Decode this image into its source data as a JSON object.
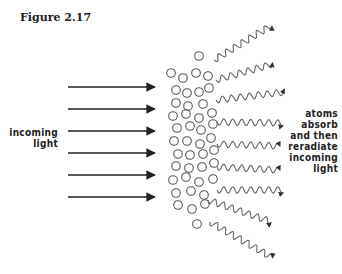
{
  "figure": {
    "title": "Figure 2.17",
    "left_label": [
      "incoming",
      "light"
    ],
    "right_label": [
      "atoms",
      "absorb",
      "and then",
      "reradiate",
      "incoming",
      "light"
    ]
  },
  "diagram": {
    "incoming_arrows": {
      "count": 6,
      "x_start": 68,
      "x_end": 155,
      "y": [
        87,
        109,
        131,
        153,
        175,
        197
      ]
    },
    "atoms": [
      [
        199,
        56
      ],
      [
        171,
        73
      ],
      [
        183,
        78
      ],
      [
        196,
        73
      ],
      [
        208,
        76
      ],
      [
        176,
        90
      ],
      [
        187,
        93
      ],
      [
        199,
        92
      ],
      [
        209,
        88
      ],
      [
        176,
        103
      ],
      [
        188,
        106
      ],
      [
        203,
        104
      ],
      [
        173,
        116
      ],
      [
        186,
        114
      ],
      [
        199,
        118
      ],
      [
        212,
        113
      ],
      [
        177,
        128
      ],
      [
        190,
        126
      ],
      [
        201,
        130
      ],
      [
        213,
        124
      ],
      [
        174,
        141
      ],
      [
        187,
        141
      ],
      [
        200,
        144
      ],
      [
        211,
        138
      ],
      [
        178,
        154
      ],
      [
        190,
        155
      ],
      [
        203,
        154
      ],
      [
        214,
        150
      ],
      [
        176,
        166
      ],
      [
        189,
        168
      ],
      [
        202,
        167
      ],
      [
        214,
        163
      ],
      [
        173,
        180
      ],
      [
        186,
        177
      ],
      [
        199,
        182
      ],
      [
        213,
        179
      ],
      [
        176,
        193
      ],
      [
        191,
        191
      ],
      [
        204,
        195
      ],
      [
        178,
        205
      ],
      [
        192,
        209
      ],
      [
        205,
        204
      ],
      [
        197,
        224
      ]
    ],
    "reradiated_waves": [
      {
        "x1": 214,
        "y1": 60,
        "x2": 272,
        "y2": 25
      },
      {
        "x1": 216,
        "y1": 80,
        "x2": 273,
        "y2": 64
      },
      {
        "x1": 216,
        "y1": 100,
        "x2": 285,
        "y2": 92
      },
      {
        "x1": 217,
        "y1": 122,
        "x2": 283,
        "y2": 123
      },
      {
        "x1": 217,
        "y1": 144,
        "x2": 280,
        "y2": 146
      },
      {
        "x1": 217,
        "y1": 167,
        "x2": 280,
        "y2": 170
      },
      {
        "x1": 217,
        "y1": 190,
        "x2": 283,
        "y2": 190
      },
      {
        "x1": 208,
        "y1": 200,
        "x2": 272,
        "y2": 222
      },
      {
        "x1": 210,
        "y1": 222,
        "x2": 273,
        "y2": 258
      }
    ],
    "colors": {
      "ink": "#222222",
      "circle": "#555555",
      "wave": "#666666"
    }
  }
}
